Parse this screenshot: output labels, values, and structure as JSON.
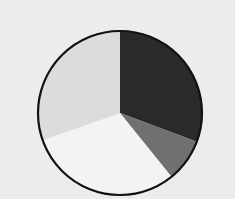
{
  "chart_data": {
    "type": "pie",
    "title": "",
    "labels": [
      "",
      "",
      "",
      ""
    ],
    "values": [
      30.7,
      8.5,
      30.4,
      30.4
    ],
    "colors": [
      "#2a2a2a",
      "#707070",
      "#f3f3f3",
      "#dcdcdc"
    ],
    "start_angle_deg": 0,
    "direction": "clockwise",
    "legend": "none",
    "outline_color": "#111111"
  },
  "layout": {
    "background": "#ececec",
    "center": [
      120,
      113
    ],
    "radius": 82
  }
}
